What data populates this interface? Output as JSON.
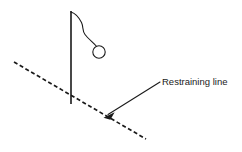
{
  "figure": {
    "background_color": "#ffffff",
    "ink_color": "#1a1a1a",
    "width": 242,
    "height": 152
  },
  "annotations": [
    {
      "id": "restraining-line-label",
      "text": "Restraining line",
      "x": 162,
      "y": 85,
      "font_size": 9.5
    }
  ],
  "elements": {
    "pole": {
      "name": "vertical-pole",
      "x1": 71,
      "y1": 11,
      "x2": 71,
      "y2": 104
    },
    "rope": {
      "name": "hanging-rope",
      "path": "M 71 12 C 76 13 79 17 81 22 C 83 27 82 31 85 35 C 88 39 92 42 96 45"
    },
    "bob": {
      "name": "pendulum-bob",
      "cx": 99,
      "cy": 52,
      "r": 6.2
    },
    "restraining_line": {
      "name": "restraining-line",
      "style": "dashed",
      "x1": 14,
      "y1": 62,
      "x2": 146,
      "y2": 139
    },
    "leader": {
      "name": "leader-line",
      "x1": 160,
      "y1": 82,
      "x2": 107,
      "y2": 115,
      "arrow_tip_x": 104,
      "arrow_tip_y": 117,
      "arrow_points": "104,117.5 114,112.8 110.6,119.4"
    }
  }
}
